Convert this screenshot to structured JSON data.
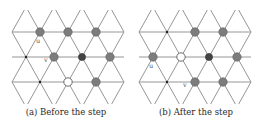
{
  "figure": {
    "colors": {
      "line": "#8a8a8a",
      "gray_vertex": "#7d7d7d",
      "gray_stroke": "#5a5a5a",
      "dark_vertex": "#444444",
      "open_fill": "#ffffff",
      "open_stroke": "#6a6a6a",
      "dot": "#222222",
      "label": "#555555"
    },
    "lattice": {
      "row_y": [
        7,
        32,
        57,
        82,
        107
      ],
      "dx": 28,
      "xmin": 12,
      "xmax": 124
    },
    "panels": [
      {
        "id": "a",
        "caption": "(a) Before the step",
        "x0": 12,
        "vertices": [
          {
            "x": 40,
            "y": 32,
            "type": "gray",
            "label": "u",
            "lx": 36,
            "ly": 43
          },
          {
            "x": 68,
            "y": 32,
            "type": "gray"
          },
          {
            "x": 96,
            "y": 32,
            "type": "gray"
          },
          {
            "x": 26,
            "y": 57,
            "type": "dot"
          },
          {
            "x": 54,
            "y": 57,
            "type": "gray",
            "label": "v",
            "lx": 44,
            "ly": 62
          },
          {
            "x": 82,
            "y": 57,
            "type": "dark"
          },
          {
            "x": 110,
            "y": 57,
            "type": "gray"
          },
          {
            "x": 40,
            "y": 82,
            "type": "dot"
          },
          {
            "x": 68,
            "y": 82,
            "type": "open"
          },
          {
            "x": 96,
            "y": 82,
            "type": "gray"
          }
        ]
      },
      {
        "id": "b",
        "caption": "(b) After the step",
        "x0": 7,
        "vertices": [
          {
            "x": 35,
            "y": 32,
            "type": "dot"
          },
          {
            "x": 63,
            "y": 32,
            "type": "gray"
          },
          {
            "x": 91,
            "y": 32,
            "type": "gray"
          },
          {
            "x": 21,
            "y": 57,
            "type": "gray",
            "label": "u",
            "lx": 17,
            "ly": 68
          },
          {
            "x": 49,
            "y": 57,
            "type": "open"
          },
          {
            "x": 77,
            "y": 57,
            "type": "dark"
          },
          {
            "x": 105,
            "y": 57,
            "type": "gray"
          },
          {
            "x": 35,
            "y": 82,
            "type": "dot"
          },
          {
            "x": 63,
            "y": 82,
            "type": "gray",
            "label": "v",
            "lx": 51,
            "ly": 87
          },
          {
            "x": 91,
            "y": 82,
            "type": "gray"
          }
        ]
      }
    ]
  }
}
